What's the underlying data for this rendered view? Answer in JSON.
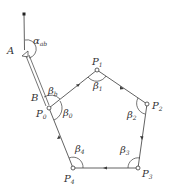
{
  "diagram": {
    "type": "closed traverse survey diagram",
    "colors": {
      "line": "#3a3a3a",
      "text": "#333333",
      "background": "#ffffff"
    },
    "known_points": {
      "top": {
        "label": "",
        "x": 24,
        "y": 14
      },
      "A": {
        "label": "A",
        "x": 25,
        "y": 50
      },
      "B": {
        "label": "B",
        "x": 47,
        "y": 104
      }
    },
    "stations": [
      {
        "id": "P0",
        "label": "P",
        "sub": "0",
        "x": 49,
        "y": 108
      },
      {
        "id": "P1",
        "label": "P",
        "sub": "1",
        "x": 97,
        "y": 70
      },
      {
        "id": "P2",
        "label": "P",
        "sub": "2",
        "x": 147,
        "y": 104
      },
      {
        "id": "P3",
        "label": "P",
        "sub": "3",
        "x": 138,
        "y": 168
      },
      {
        "id": "P4",
        "label": "P",
        "sub": "4",
        "x": 73,
        "y": 168
      }
    ],
    "angles": [
      {
        "id": "alpha_ab",
        "label": "α",
        "sub": "ab"
      },
      {
        "id": "beta_b",
        "label": "β",
        "sub": "b"
      },
      {
        "id": "beta_0",
        "label": "β",
        "sub": "0"
      },
      {
        "id": "beta_1",
        "label": "β",
        "sub": "1"
      },
      {
        "id": "beta_2",
        "label": "β",
        "sub": "2"
      },
      {
        "id": "beta_3",
        "label": "β",
        "sub": "3"
      },
      {
        "id": "beta_4",
        "label": "β",
        "sub": "4"
      }
    ],
    "labels": {
      "A": "A",
      "B": "B",
      "P": "P"
    }
  }
}
